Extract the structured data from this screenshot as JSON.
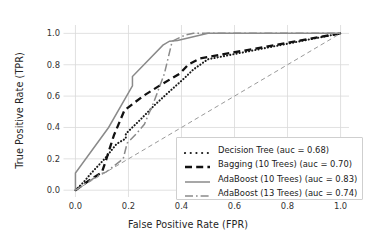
{
  "chart_data": {
    "type": "line",
    "title": "",
    "xlabel": "False Positive Rate (FPR)",
    "ylabel": "True Positive Rate (TPR)",
    "xlim": [
      -0.03,
      1.03
    ],
    "ylim": [
      -0.04,
      1.05
    ],
    "xticks": [
      "0.0",
      "0.2",
      "0.4",
      "0.6",
      "0.8",
      "1.0"
    ],
    "xtick_values": [
      0.0,
      0.2,
      0.4,
      0.6,
      0.8,
      1.0
    ],
    "yticks": [
      "0.0",
      "0.2",
      "0.4",
      "0.6",
      "0.8",
      "1.0"
    ],
    "ytick_values": [
      0.0,
      0.2,
      0.4,
      0.6,
      0.8,
      1.0
    ],
    "grid": true,
    "legend_position": "lower right",
    "series": [
      {
        "name": "Decision Tree (auc = 0.68)",
        "label": "Decision Tree (auc = 0.68)",
        "auc": 0.68,
        "style": "dotted",
        "color": "#1a1a1a",
        "points": [
          [
            0.0,
            0.0
          ],
          [
            0.03,
            0.05
          ],
          [
            0.06,
            0.11
          ],
          [
            0.11,
            0.2
          ],
          [
            0.155,
            0.295
          ],
          [
            0.19,
            0.33
          ],
          [
            0.19,
            0.36
          ],
          [
            0.245,
            0.45
          ],
          [
            0.3,
            0.545
          ],
          [
            0.355,
            0.63
          ],
          [
            0.405,
            0.705
          ],
          [
            0.445,
            0.77
          ],
          [
            0.5,
            0.835
          ],
          [
            1.0,
            1.0
          ]
        ]
      },
      {
        "name": "Bagging (10 Trees) (auc = 0.70)",
        "label": "Bagging (10 Trees) (auc = 0.70)",
        "auc": 0.7,
        "style": "dashed",
        "color": "#111111",
        "points": [
          [
            0.0,
            0.0
          ],
          [
            0.05,
            0.06
          ],
          [
            0.1,
            0.115
          ],
          [
            0.115,
            0.19
          ],
          [
            0.145,
            0.35
          ],
          [
            0.185,
            0.51
          ],
          [
            0.255,
            0.6
          ],
          [
            0.325,
            0.675
          ],
          [
            0.395,
            0.745
          ],
          [
            0.425,
            0.8
          ],
          [
            0.47,
            0.84
          ],
          [
            1.0,
            1.0
          ]
        ]
      },
      {
        "name": "AdaBoost (10 Trees) (auc = 0.83)",
        "label": "AdaBoost (10 Trees) (auc = 0.83)",
        "auc": 0.83,
        "style": "solid",
        "color": "#8a8a8a",
        "points": [
          [
            0.0,
            0.0
          ],
          [
            0.0,
            0.11
          ],
          [
            0.125,
            0.4
          ],
          [
            0.215,
            0.665
          ],
          [
            0.215,
            0.725
          ],
          [
            0.33,
            0.925
          ],
          [
            0.355,
            0.95
          ],
          [
            0.385,
            0.955
          ],
          [
            0.5,
            1.0
          ],
          [
            1.0,
            1.0
          ]
        ]
      },
      {
        "name": "AdaBoost (13 Trees) (auc = 0.74)",
        "label": "AdaBoost (13 Trees) (auc = 0.74)",
        "auc": 0.74,
        "style": "dashdot",
        "color": "#8a8a8a",
        "points": [
          [
            0.0,
            0.0
          ],
          [
            0.045,
            0.05
          ],
          [
            0.095,
            0.105
          ],
          [
            0.115,
            0.115
          ],
          [
            0.18,
            0.2
          ],
          [
            0.195,
            0.3
          ],
          [
            0.23,
            0.36
          ],
          [
            0.26,
            0.42
          ],
          [
            0.295,
            0.56
          ],
          [
            0.335,
            0.74
          ],
          [
            0.365,
            0.95
          ],
          [
            0.415,
            0.99
          ],
          [
            0.445,
            1.0
          ],
          [
            1.0,
            1.0
          ]
        ]
      },
      {
        "name": "chance",
        "label": "",
        "auc": 0.5,
        "style": "dashed-thin",
        "color": "#9a9a9a",
        "points": [
          [
            0.0,
            0.0
          ],
          [
            1.0,
            1.0
          ]
        ]
      }
    ]
  },
  "legend": {
    "entries": [
      {
        "label": "Decision Tree (auc = 0.68)",
        "style": "dotted",
        "color": "#1a1a1a"
      },
      {
        "label": "Bagging (10 Trees) (auc = 0.70)",
        "style": "dashed",
        "color": "#111111"
      },
      {
        "label": "AdaBoost (10 Trees) (auc = 0.83)",
        "style": "solid",
        "color": "#8a8a8a"
      },
      {
        "label": "AdaBoost (13 Trees) (auc = 0.74)",
        "style": "dashdot",
        "color": "#8a8a8a"
      }
    ]
  },
  "colors": {
    "background": "#ffffff",
    "grid": "#d9d9d9",
    "text": "#262626"
  }
}
